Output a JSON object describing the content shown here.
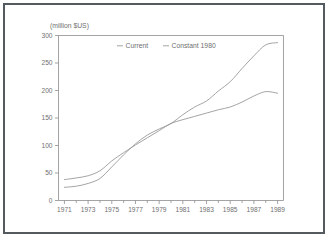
{
  "figure": {
    "background_color": "#ffffff",
    "border_color": "#555a5e",
    "axis_color": "#8d8d8d",
    "line_color": "#9a9a9a",
    "text_color": "#6f6f6f"
  },
  "chart_data": {
    "type": "line",
    "title": "",
    "subtitle": "",
    "xlabel": "",
    "ylabel": "(million $US)",
    "ylim": [
      0,
      300
    ],
    "xlim": [
      1970.5,
      1989.5
    ],
    "grid": false,
    "legend_position": "top-center",
    "y_ticks": [
      "0",
      "50",
      "100",
      "150",
      "200",
      "250",
      "300"
    ],
    "y_tick_values": [
      0,
      50,
      100,
      150,
      200,
      250,
      300
    ],
    "x_ticks": [
      "1971",
      "1973",
      "1975",
      "1977",
      "1979",
      "1981",
      "1983",
      "1985",
      "1987",
      "1989"
    ],
    "x_tick_values": [
      1971,
      1973,
      1975,
      1977,
      1979,
      1981,
      1983,
      1985,
      1987,
      1989
    ],
    "x_minor_tick_values": [
      1972,
      1974,
      1976,
      1978,
      1980,
      1982,
      1984,
      1986,
      1988
    ],
    "x": [
      1971,
      1972,
      1973,
      1974,
      1975,
      1976,
      1977,
      1978,
      1979,
      1980,
      1981,
      1982,
      1983,
      1984,
      1985,
      1986,
      1987,
      1988,
      1989
    ],
    "series": [
      {
        "name": "Current",
        "values": [
          24,
          26,
          31,
          40,
          61,
          83,
          103,
          119,
          130,
          140,
          156,
          170,
          181,
          199,
          216,
          240,
          263,
          283,
          287
        ]
      },
      {
        "name": "Constant 1980",
        "values": [
          38,
          41,
          45,
          54,
          72,
          87,
          101,
          114,
          127,
          140,
          147,
          153,
          159,
          165,
          170,
          179,
          190,
          198,
          195
        ]
      }
    ],
    "legend": [
      "Current",
      "Constant 1980"
    ],
    "annotations": []
  }
}
